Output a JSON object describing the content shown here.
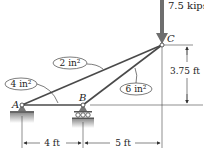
{
  "diagram": {
    "type": "truss",
    "nodes": {
      "A": {
        "label": "A",
        "support": "pin"
      },
      "B": {
        "label": "B",
        "support": "roller"
      },
      "C": {
        "label": "C",
        "support": "none"
      }
    },
    "members": [
      {
        "from": "A",
        "to": "B",
        "area_label": "4 in²"
      },
      {
        "from": "A",
        "to": "C",
        "area_label": "2 in²"
      },
      {
        "from": "B",
        "to": "C",
        "area_label": "6 in²"
      }
    ],
    "load": {
      "node": "C",
      "label": "7.5 kips",
      "direction": "down"
    },
    "dimensions": {
      "height_label": "3.75 ft",
      "span_ab_label": "4 ft",
      "span_bc_label": "5 ft"
    },
    "colors": {
      "member": "#4a4a4a",
      "load_arrow": "#6e6e6e",
      "ground": "#9a9a9a",
      "text": "#222222"
    }
  }
}
